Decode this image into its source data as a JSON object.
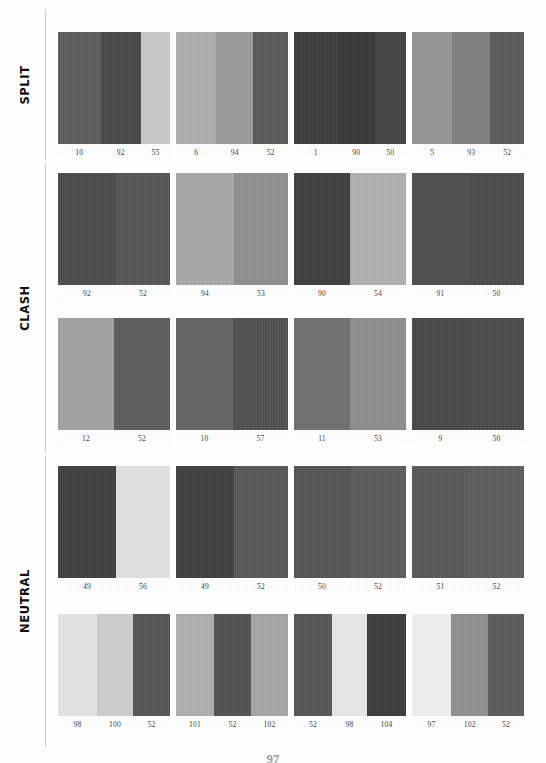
{
  "page": {
    "folio": "97",
    "background": "#fefefe",
    "rule_color": "#c9c9c9",
    "label_color": "#111111",
    "number_color": "#3a3a3a"
  },
  "sections": [
    {
      "id": "split",
      "label": "SPLIT",
      "rows": [
        {
          "id": "split-row-1",
          "cards": [
            {
              "id": "split-1",
              "swatches": [
                {
                  "number": "10",
                  "color": "#5d5d5d",
                  "width": 38
                },
                {
                  "number": "92",
                  "color": "#474747",
                  "width": 36
                },
                {
                  "number": "55",
                  "color": "#c9c9c9",
                  "width": 26
                }
              ]
            },
            {
              "id": "split-2",
              "swatches": [
                {
                  "number": "6",
                  "color": "#acacac",
                  "width": 36
                },
                {
                  "number": "94",
                  "color": "#9a9a9a",
                  "width": 33
                },
                {
                  "number": "52",
                  "color": "#5a5a5a",
                  "width": 31
                }
              ]
            },
            {
              "id": "split-3",
              "swatches": [
                {
                  "number": "1",
                  "color": "#3c3c3c",
                  "width": 39
                },
                {
                  "number": "90",
                  "color": "#383838",
                  "width": 33
                },
                {
                  "number": "50",
                  "color": "#434343",
                  "width": 28
                }
              ]
            },
            {
              "id": "split-4",
              "swatches": [
                {
                  "number": "5",
                  "color": "#949494",
                  "width": 36
                },
                {
                  "number": "93",
                  "color": "#7e7e7e",
                  "width": 34
                },
                {
                  "number": "52",
                  "color": "#5b5b5b",
                  "width": 30
                }
              ]
            }
          ]
        }
      ]
    },
    {
      "id": "clash",
      "label": "CLASH",
      "rows": [
        {
          "id": "clash-row-1",
          "cards": [
            {
              "id": "clash-1",
              "swatches": [
                {
                  "number": "92",
                  "color": "#4b4b4b",
                  "width": 52
                },
                {
                  "number": "52",
                  "color": "#555555",
                  "width": 48
                }
              ]
            },
            {
              "id": "clash-2",
              "swatches": [
                {
                  "number": "94",
                  "color": "#a6a6a6",
                  "width": 52
                },
                {
                  "number": "53",
                  "color": "#8e8e8e",
                  "width": 48
                }
              ]
            },
            {
              "id": "clash-3",
              "swatches": [
                {
                  "number": "90",
                  "color": "#3e3e3e",
                  "width": 50
                },
                {
                  "number": "54",
                  "color": "#adadad",
                  "width": 50
                }
              ]
            },
            {
              "id": "clash-4",
              "swatches": [
                {
                  "number": "91",
                  "color": "#4c4c4c",
                  "width": 51
                },
                {
                  "number": "50",
                  "color": "#4a4a4a",
                  "width": 49
                }
              ]
            }
          ]
        },
        {
          "id": "clash-row-2",
          "cards": [
            {
              "id": "clash-5",
              "swatches": [
                {
                  "number": "12",
                  "color": "#a0a0a0",
                  "width": 50
                },
                {
                  "number": "52",
                  "color": "#5c5c5c",
                  "width": 50
                }
              ]
            },
            {
              "id": "clash-6",
              "swatches": [
                {
                  "number": "10",
                  "color": "#626262",
                  "width": 51
                },
                {
                  "number": "57",
                  "color": "#4f4f4f",
                  "width": 49
                }
              ]
            },
            {
              "id": "clash-7",
              "swatches": [
                {
                  "number": "11",
                  "color": "#6e6e6e",
                  "width": 50
                },
                {
                  "number": "53",
                  "color": "#8c8c8c",
                  "width": 50
                }
              ]
            },
            {
              "id": "clash-8",
              "swatches": [
                {
                  "number": "9",
                  "color": "#474747",
                  "width": 51
                },
                {
                  "number": "50",
                  "color": "#4b4b4b",
                  "width": 49
                }
              ]
            }
          ]
        }
      ]
    },
    {
      "id": "neutral",
      "label": "NEUTRAL",
      "rows": [
        {
          "id": "neutral-row-1",
          "cards": [
            {
              "id": "neutral-1",
              "swatches": [
                {
                  "number": "49",
                  "color": "#3f3f3f",
                  "width": 52
                },
                {
                  "number": "56",
                  "color": "#e0e0e0",
                  "width": 48
                }
              ]
            },
            {
              "id": "neutral-2",
              "swatches": [
                {
                  "number": "49",
                  "color": "#3f3f3f",
                  "width": 52
                },
                {
                  "number": "52",
                  "color": "#575757",
                  "width": 48
                }
              ]
            },
            {
              "id": "neutral-3",
              "swatches": [
                {
                  "number": "50",
                  "color": "#545454",
                  "width": 50
                },
                {
                  "number": "52",
                  "color": "#5b5b5b",
                  "width": 50
                }
              ]
            },
            {
              "id": "neutral-4",
              "swatches": [
                {
                  "number": "51",
                  "color": "#585858",
                  "width": 51
                },
                {
                  "number": "52",
                  "color": "#5d5d5d",
                  "width": 49
                }
              ]
            }
          ]
        },
        {
          "id": "neutral-row-2",
          "cards": [
            {
              "id": "neutral-5",
              "swatches": [
                {
                  "number": "98",
                  "color": "#e2e2e2",
                  "width": 35
                },
                {
                  "number": "100",
                  "color": "#cccccc",
                  "width": 32
                },
                {
                  "number": "52",
                  "color": "#555555",
                  "width": 33
                }
              ]
            },
            {
              "id": "neutral-6",
              "swatches": [
                {
                  "number": "101",
                  "color": "#adadad",
                  "width": 34
                },
                {
                  "number": "52",
                  "color": "#525252",
                  "width": 33
                },
                {
                  "number": "102",
                  "color": "#a4a4a4",
                  "width": 33
                }
              ]
            },
            {
              "id": "neutral-7",
              "swatches": [
                {
                  "number": "52",
                  "color": "#555555",
                  "width": 34
                },
                {
                  "number": "98",
                  "color": "#e6e6e6",
                  "width": 31
                },
                {
                  "number": "104",
                  "color": "#3b3b3b",
                  "width": 35
                }
              ]
            },
            {
              "id": "neutral-8",
              "swatches": [
                {
                  "number": "97",
                  "color": "#efefef",
                  "width": 35
                },
                {
                  "number": "102",
                  "color": "#8e8e8e",
                  "width": 33
                },
                {
                  "number": "52",
                  "color": "#5a5a5a",
                  "width": 32
                }
              ]
            }
          ]
        }
      ]
    }
  ]
}
